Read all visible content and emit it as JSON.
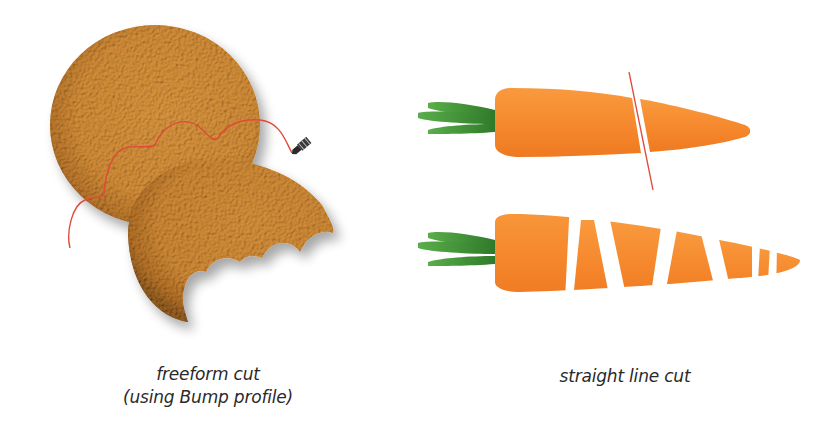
{
  "colors": {
    "background": "#ffffff",
    "cookie_base": "#d4903a",
    "cookie_dark": "#6b3d10",
    "cookie_light": "#e6a550",
    "cut_line": "#e04a3a",
    "carrot_orange": "#f5862b",
    "carrot_light": "#f9a04a",
    "carrot_leaf": "#3c8f35",
    "carrot_leaf_light": "#5aae4a",
    "caption_text": "#2a2a2a"
  },
  "panels": [
    {
      "id": "freeform",
      "illustration": "cookie-freeform-cut",
      "icons": [
        "knife-cursor-icon"
      ],
      "caption_lines": [
        "freeform cut",
        "(using Bump profile)"
      ]
    },
    {
      "id": "straight",
      "illustration": "carrot-straight-line-cut",
      "caption_lines": [
        "straight line cut"
      ]
    }
  ]
}
